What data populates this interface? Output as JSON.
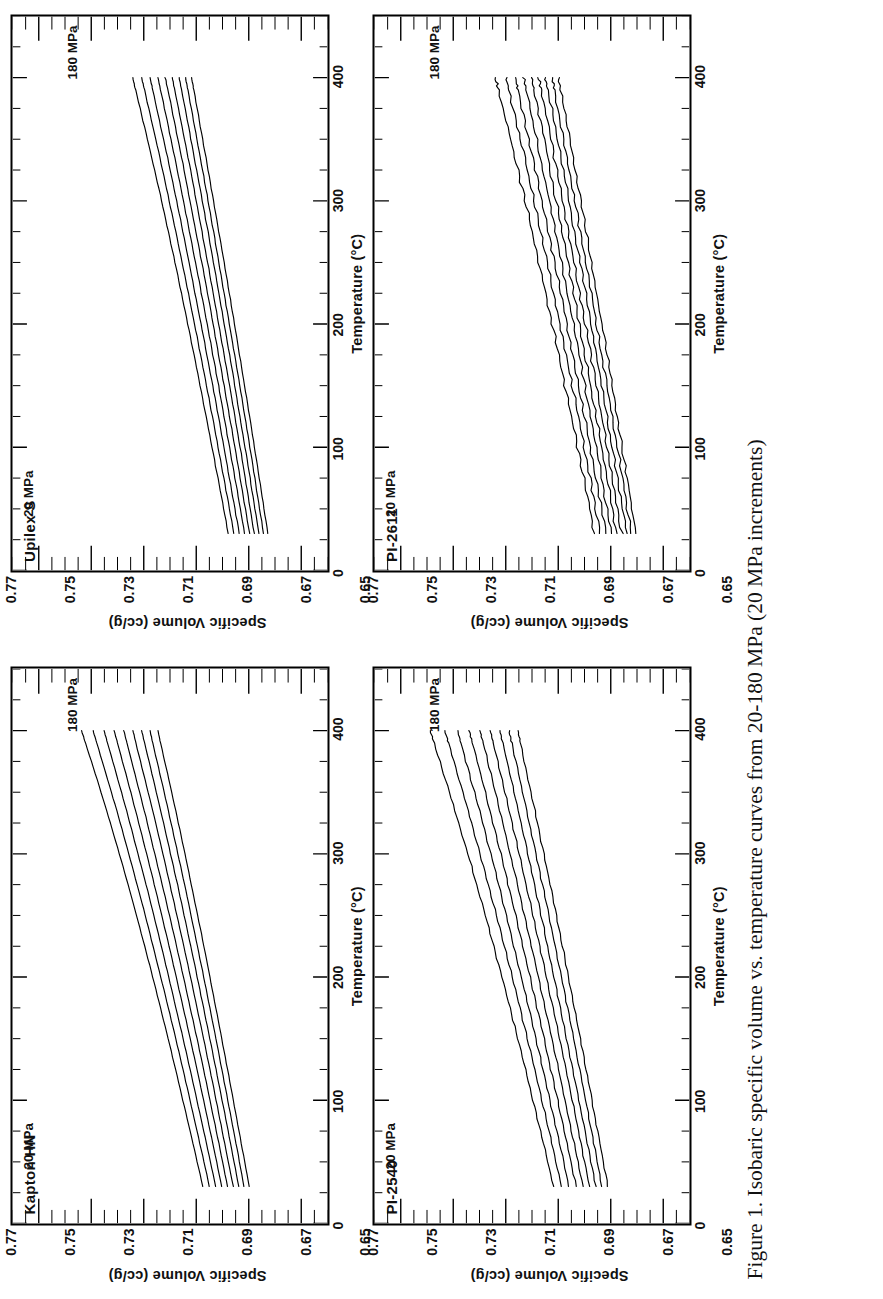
{
  "figure": {
    "caption_line1": "Figure 1. Isobaric specific volume vs. temperature curves from 20-180 MPa (20",
    "caption_line2": "MPa increments)"
  },
  "axes": {
    "xlabel": "Temperature  (°C)",
    "ylabel": "Specific  Volume  (cc/g)",
    "xticks": [
      "0",
      "100",
      "200",
      "300",
      "400"
    ],
    "yticks": [
      "0.65",
      "0.67",
      "0.69",
      "0.71",
      "0.73",
      "0.75",
      "0.77"
    ],
    "xlim": [
      0,
      450
    ],
    "ylim": [
      0.65,
      0.77
    ],
    "xminor_step": 25,
    "yminor_step": 0.005
  },
  "annotations": {
    "low_pressure": "20 MPa",
    "high_pressure": "180 MPa"
  },
  "panels": [
    {
      "id": "kapton-hn",
      "title": "Kapton HN"
    },
    {
      "id": "upilex-s",
      "title": "Upilex S"
    },
    {
      "id": "pi-2540",
      "title": "PI-2540"
    },
    {
      "id": "pi-2611",
      "title": "PI-2611"
    }
  ],
  "chart_data": {
    "type": "line",
    "title": "Isobaric specific volume vs. temperature curves from 20-180 MPa (20 MPa increments)",
    "xlabel": "Temperature (°C)",
    "ylabel": "Specific Volume (cc/g)",
    "xlim": [
      0,
      450
    ],
    "ylim": [
      0.65,
      0.77
    ],
    "grid": false,
    "legend": "inline-annotations",
    "pressures_MPa": [
      20,
      40,
      60,
      80,
      100,
      120,
      140,
      160,
      180
    ],
    "x": [
      30,
      60,
      90,
      120,
      150,
      180,
      210,
      240,
      270,
      300,
      330,
      360,
      390,
      400
    ],
    "panels": [
      {
        "name": "Kapton HN",
        "series": [
          {
            "name": "20 MPa",
            "values": [
              0.6975,
              0.7007,
              0.704,
              0.7073,
              0.7107,
              0.7142,
              0.7178,
              0.7215,
              0.7253,
              0.7293,
              0.7334,
              0.7377,
              0.7422,
              0.7437
            ]
          },
          {
            "name": "40 MPa",
            "values": [
              0.695,
              0.6981,
              0.7013,
              0.7045,
              0.7078,
              0.7112,
              0.7147,
              0.7182,
              0.7219,
              0.7257,
              0.7296,
              0.7337,
              0.7379,
              0.7393
            ]
          },
          {
            "name": "60 MPa",
            "values": [
              0.6926,
              0.6956,
              0.6987,
              0.7018,
              0.705,
              0.7083,
              0.7116,
              0.715,
              0.7185,
              0.7222,
              0.7259,
              0.7298,
              0.7338,
              0.7351
            ]
          },
          {
            "name": "80 MPa",
            "values": [
              0.6903,
              0.6932,
              0.6962,
              0.6992,
              0.7023,
              0.7055,
              0.7087,
              0.712,
              0.7154,
              0.7189,
              0.7225,
              0.7262,
              0.73,
              0.7313
            ]
          },
          {
            "name": "100 MPa",
            "values": [
              0.6881,
              0.6909,
              0.6938,
              0.6967,
              0.6997,
              0.7028,
              0.7059,
              0.7091,
              0.7124,
              0.7158,
              0.7192,
              0.7228,
              0.7264,
              0.7276
            ]
          },
          {
            "name": "120 MPa",
            "values": [
              0.6859,
              0.6887,
              0.6915,
              0.6943,
              0.6972,
              0.7002,
              0.7032,
              0.7063,
              0.7095,
              0.7127,
              0.716,
              0.7195,
              0.723,
              0.7241
            ]
          },
          {
            "name": "140 MPa",
            "values": [
              0.6838,
              0.6865,
              0.6892,
              0.692,
              0.6948,
              0.6977,
              0.7006,
              0.7036,
              0.7066,
              0.7098,
              0.713,
              0.7163,
              0.7197,
              0.7208
            ]
          },
          {
            "name": "160 MPa",
            "values": [
              0.6818,
              0.6844,
              0.6871,
              0.6898,
              0.6925,
              0.6953,
              0.6981,
              0.701,
              0.7039,
              0.707,
              0.7101,
              0.7133,
              0.7166,
              0.7176
            ]
          },
          {
            "name": "180 MPa",
            "values": [
              0.6798,
              0.6824,
              0.685,
              0.6876,
              0.6903,
              0.693,
              0.6957,
              0.6985,
              0.7014,
              0.7043,
              0.7073,
              0.7104,
              0.7136,
              0.7146
            ]
          }
        ]
      },
      {
        "name": "Upilex S",
        "series": [
          {
            "name": "20 MPa",
            "values": [
              0.6878,
              0.6904,
              0.6931,
              0.6958,
              0.6985,
              0.7013,
              0.7042,
              0.7071,
              0.7101,
              0.7132,
              0.7164,
              0.7197,
              0.7231,
              0.7242
            ]
          },
          {
            "name": "40 MPa",
            "values": [
              0.6857,
              0.6882,
              0.6908,
              0.6934,
              0.6961,
              0.6988,
              0.7016,
              0.7044,
              0.7073,
              0.7103,
              0.7133,
              0.7165,
              0.7197,
              0.7208
            ]
          },
          {
            "name": "60 MPa",
            "values": [
              0.6836,
              0.6861,
              0.6886,
              0.6911,
              0.6937,
              0.6964,
              0.6991,
              0.7018,
              0.7046,
              0.7075,
              0.7104,
              0.7135,
              0.7166,
              0.7176
            ]
          },
          {
            "name": "80 MPa",
            "values": [
              0.6816,
              0.684,
              0.6865,
              0.689,
              0.6915,
              0.6941,
              0.6967,
              0.6994,
              0.7021,
              0.7049,
              0.7077,
              0.7106,
              0.7136,
              0.7146
            ]
          },
          {
            "name": "100 MPa",
            "values": [
              0.6797,
              0.6821,
              0.6845,
              0.6869,
              0.6894,
              0.6919,
              0.6944,
              0.697,
              0.6997,
              0.7024,
              0.7051,
              0.7079,
              0.7108,
              0.7118
            ]
          },
          {
            "name": "120 MPa",
            "values": [
              0.6779,
              0.6802,
              0.6825,
              0.6849,
              0.6873,
              0.6898,
              0.6923,
              0.6948,
              0.6974,
              0.7,
              0.7026,
              0.7054,
              0.7082,
              0.7091
            ]
          },
          {
            "name": "140 MPa",
            "values": [
              0.6761,
              0.6784,
              0.6806,
              0.683,
              0.6853,
              0.6877,
              0.6902,
              0.6926,
              0.6951,
              0.6977,
              0.7003,
              0.7029,
              0.7056,
              0.7065
            ]
          },
          {
            "name": "160 MPa",
            "values": [
              0.6744,
              0.6766,
              0.6788,
              0.6811,
              0.6834,
              0.6858,
              0.6882,
              0.6906,
              0.693,
              0.6955,
              0.698,
              0.7006,
              0.7032,
              0.7041
            ]
          },
          {
            "name": "180 MPa",
            "values": [
              0.6727,
              0.6749,
              0.6771,
              0.6793,
              0.6816,
              0.6839,
              0.6862,
              0.6886,
              0.691,
              0.6934,
              0.6959,
              0.6984,
              0.7009,
              0.7018
            ]
          }
        ]
      },
      {
        "name": "PI-2540",
        "series": [
          {
            "name": "20 MPa",
            "values": [
              0.7018,
              0.7051,
              0.7085,
              0.7119,
              0.7154,
              0.719,
              0.7227,
              0.7265,
              0.7304,
              0.7344,
              0.7386,
              0.7429,
              0.7473,
              0.7488
            ]
          },
          {
            "name": "40 MPa",
            "values": [
              0.6987,
              0.7019,
              0.7051,
              0.7084,
              0.7118,
              0.7152,
              0.7187,
              0.7223,
              0.726,
              0.7298,
              0.7337,
              0.7377,
              0.7418,
              0.7432
            ]
          },
          {
            "name": "60 MPa",
            "values": [
              0.6959,
              0.699,
              0.7021,
              0.7053,
              0.7085,
              0.7118,
              0.7152,
              0.7186,
              0.7221,
              0.7257,
              0.7294,
              0.7332,
              0.7371,
              0.7384
            ]
          },
          {
            "name": "80 MPa",
            "values": [
              0.6932,
              0.6962,
              0.6992,
              0.7023,
              0.7054,
              0.7086,
              0.7118,
              0.7151,
              0.7185,
              0.7219,
              0.7254,
              0.729,
              0.7327,
              0.7339
            ]
          },
          {
            "name": "100 MPa",
            "values": [
              0.6906,
              0.6935,
              0.6964,
              0.6994,
              0.7024,
              0.7055,
              0.7086,
              0.7118,
              0.715,
              0.7183,
              0.7217,
              0.7251,
              0.7286,
              0.7298
            ]
          },
          {
            "name": "120 MPa",
            "values": [
              0.6881,
              0.6909,
              0.6937,
              0.6966,
              0.6995,
              0.7025,
              0.7055,
              0.7086,
              0.7117,
              0.7149,
              0.7181,
              0.7214,
              0.7248,
              0.7259
            ]
          },
          {
            "name": "140 MPa",
            "values": [
              0.6857,
              0.6884,
              0.6912,
              0.694,
              0.6968,
              0.6997,
              0.7026,
              0.7055,
              0.7085,
              0.7116,
              0.7147,
              0.7179,
              0.7211,
              0.7222
            ]
          },
          {
            "name": "160 MPa",
            "values": [
              0.6834,
              0.686,
              0.6887,
              0.6914,
              0.6941,
              0.6969,
              0.6997,
              0.7026,
              0.7055,
              0.7085,
              0.7115,
              0.7146,
              0.7177,
              0.7187
            ]
          },
          {
            "name": "180 MPa",
            "values": [
              0.6811,
              0.6837,
              0.6863,
              0.6889,
              0.6916,
              0.6943,
              0.697,
              0.6998,
              0.7026,
              0.7055,
              0.7084,
              0.7114,
              0.7144,
              0.7154
            ]
          }
        ]
      },
      {
        "name": "PI-2611",
        "series": [
          {
            "name": "20 MPa",
            "values": [
              0.6862,
              0.6889,
              0.6917,
              0.6945,
              0.6974,
              0.7003,
              0.7033,
              0.7063,
              0.7094,
              0.7126,
              0.7159,
              0.7193,
              0.7228,
              0.724
            ]
          },
          {
            "name": "40 MPa",
            "values": [
              0.6839,
              0.6866,
              0.6892,
              0.6919,
              0.6947,
              0.6975,
              0.7004,
              0.7033,
              0.7062,
              0.7092,
              0.7123,
              0.7155,
              0.7188,
              0.7199
            ]
          },
          {
            "name": "60 MPa",
            "values": [
              0.6818,
              0.6844,
              0.6869,
              0.6896,
              0.6922,
              0.6949,
              0.6977,
              0.7005,
              0.7033,
              0.7062,
              0.7092,
              0.7122,
              0.7153,
              0.7163
            ]
          },
          {
            "name": "80 MPa",
            "values": [
              0.6797,
              0.6822,
              0.6847,
              0.6873,
              0.6899,
              0.6925,
              0.6952,
              0.6979,
              0.7006,
              0.7034,
              0.7063,
              0.7092,
              0.7122,
              0.7132
            ]
          },
          {
            "name": "100 MPa",
            "values": [
              0.6777,
              0.6802,
              0.6826,
              0.6851,
              0.6876,
              0.6902,
              0.6928,
              0.6954,
              0.6981,
              0.7008,
              0.7035,
              0.7063,
              0.7092,
              0.7101
            ]
          },
          {
            "name": "120 MPa",
            "values": [
              0.6758,
              0.6782,
              0.6806,
              0.683,
              0.6855,
              0.688,
              0.6905,
              0.6931,
              0.6957,
              0.6983,
              0.701,
              0.7037,
              0.7065,
              0.7074
            ]
          },
          {
            "name": "140 MPa",
            "values": [
              0.6739,
              0.6763,
              0.6786,
              0.681,
              0.6834,
              0.6859,
              0.6883,
              0.6908,
              0.6934,
              0.6959,
              0.6985,
              0.7012,
              0.7039,
              0.7048
            ]
          },
          {
            "name": "160 MPa",
            "values": [
              0.6721,
              0.6744,
              0.6767,
              0.6791,
              0.6814,
              0.6838,
              0.6862,
              0.6887,
              0.6912,
              0.6937,
              0.6962,
              0.6988,
              0.7014,
              0.7023
            ]
          },
          {
            "name": "180 MPa",
            "values": [
              0.6704,
              0.6726,
              0.6749,
              0.6772,
              0.6795,
              0.6818,
              0.6842,
              0.6866,
              0.689,
              0.6915,
              0.694,
              0.6965,
              0.6991,
              0.7
            ]
          }
        ]
      }
    ]
  }
}
